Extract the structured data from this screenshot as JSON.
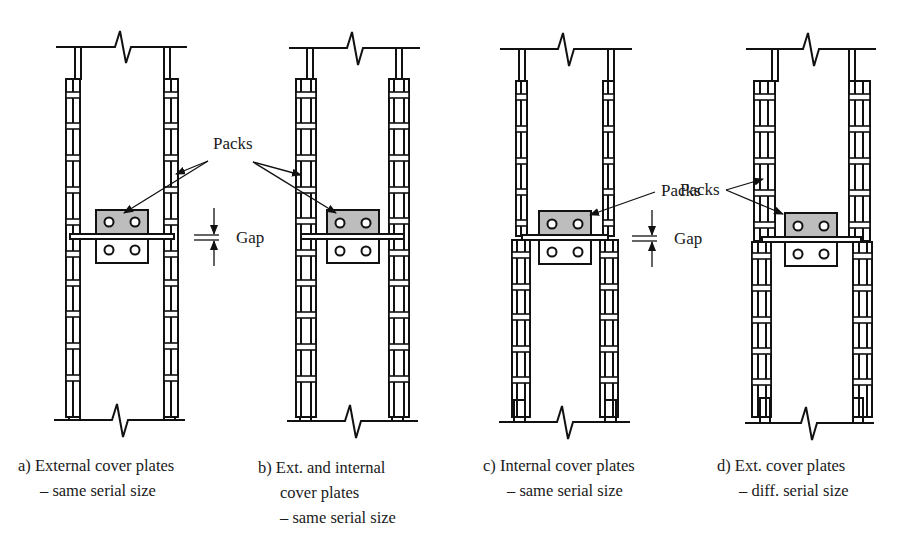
{
  "figure": {
    "panels": [
      {
        "id": "a",
        "caption_line1": "a) External cover plates",
        "caption_line2": "– same serial size",
        "caption_line3": "",
        "packs_label": "Packs",
        "gap_label": "Gap"
      },
      {
        "id": "b",
        "caption_line1": "b) Ext. and internal",
        "caption_line2": "cover plates",
        "caption_line3": "– same serial size",
        "packs_label": "",
        "gap_label": ""
      },
      {
        "id": "c",
        "caption_line1": "c) Internal cover plates",
        "caption_line2": "– same serial size",
        "caption_line3": "",
        "packs_label": "Packs",
        "gap_label": "Gap"
      },
      {
        "id": "d",
        "caption_line1": "d) Ext. cover plates",
        "caption_line2": "– diff. serial size",
        "caption_line3": "",
        "packs_label": "Packs",
        "gap_label": ""
      }
    ],
    "colors": {
      "line": "#111111",
      "pack_fill": "#bdbdbd",
      "background": "#ffffff"
    }
  }
}
